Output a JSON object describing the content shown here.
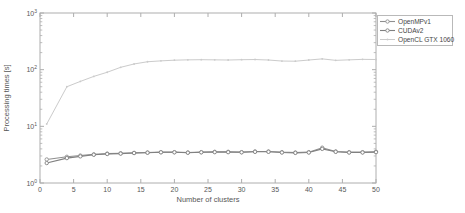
{
  "figure": {
    "x_ticks": [
      0,
      5,
      10,
      15,
      20,
      25,
      30,
      35,
      40,
      45,
      50
    ],
    "y_ticks": [
      "10^0",
      "10^1",
      "10^2",
      "10^3"
    ],
    "spine_color": "#aeaeae",
    "tick_text_color": "#575757"
  },
  "chart_data": {
    "type": "line",
    "title": "",
    "xlabel": "Number of clusters",
    "ylabel": "Processing times [s]",
    "xlim": [
      0,
      50
    ],
    "ylim": [
      1,
      1000
    ],
    "y_scale": "log10",
    "grid": false,
    "legend_position": "outside-top-right",
    "x": [
      1,
      4,
      6,
      8,
      10,
      12,
      14,
      16,
      18,
      20,
      22,
      24,
      26,
      28,
      30,
      32,
      34,
      36,
      38,
      40,
      42,
      44,
      46,
      48,
      50
    ],
    "series": [
      {
        "name": "OpenMPv1",
        "color": "#8f8f8f",
        "marker": "circle-open",
        "line_width": 1.1,
        "values": [
          2.6,
          2.9,
          3.05,
          3.2,
          3.3,
          3.35,
          3.4,
          3.45,
          3.5,
          3.5,
          3.45,
          3.5,
          3.55,
          3.55,
          3.5,
          3.6,
          3.6,
          3.5,
          3.45,
          3.5,
          4.2,
          3.6,
          3.5,
          3.5,
          3.55
        ]
      },
      {
        "name": "CUDAv2",
        "color": "#808080",
        "marker": "circle-open",
        "line_width": 1.1,
        "values": [
          2.25,
          2.75,
          2.95,
          3.15,
          3.25,
          3.3,
          3.38,
          3.42,
          3.48,
          3.48,
          3.42,
          3.48,
          3.5,
          3.5,
          3.48,
          3.55,
          3.55,
          3.45,
          3.4,
          3.45,
          4.0,
          3.55,
          3.45,
          3.45,
          3.5
        ]
      },
      {
        "name": "OpenCL GTX 1060",
        "color": "#cbcbcb",
        "marker": "dot",
        "line_width": 1.0,
        "values": [
          11,
          50,
          62,
          76,
          90,
          110,
          126,
          138,
          143,
          147,
          149,
          150,
          149,
          148,
          150,
          151,
          148,
          142,
          141,
          148,
          155,
          146,
          149,
          152,
          151
        ]
      }
    ]
  }
}
